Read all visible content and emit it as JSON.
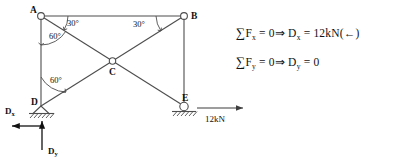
{
  "figure": {
    "nodes": [
      {
        "id": "A",
        "label": "A",
        "support": "pin-joint"
      },
      {
        "id": "B",
        "label": "B",
        "support": "pin-joint"
      },
      {
        "id": "C",
        "label": "C",
        "support": "pin-joint"
      },
      {
        "id": "D",
        "label": "D",
        "support": "pinned-support"
      },
      {
        "id": "E",
        "label": "E",
        "support": "roller-support"
      }
    ],
    "members": [
      {
        "from": "A",
        "to": "B"
      },
      {
        "from": "A",
        "to": "D"
      },
      {
        "from": "B",
        "to": "E"
      },
      {
        "from": "A",
        "to": "E"
      },
      {
        "from": "D",
        "to": "B"
      }
    ],
    "angles": [
      {
        "at": "A",
        "between": "AB-AE",
        "label": "30°"
      },
      {
        "at": "A",
        "between": "AD-AE",
        "label": "60°"
      },
      {
        "at": "B",
        "between": "BA-BD",
        "label": "30°"
      },
      {
        "at": "D",
        "between": "DA-DB",
        "label": "60°"
      }
    ],
    "forces": [
      {
        "name": "applied-load",
        "label": "12kN",
        "direction": "right",
        "at": "E"
      },
      {
        "name": "reaction-dx",
        "label": "D",
        "subscript": "x",
        "direction": "left",
        "at": "D"
      },
      {
        "name": "reaction-dy",
        "label": "D",
        "subscript": "y",
        "direction": "up",
        "at": "D"
      }
    ]
  },
  "equations": [
    {
      "id": "sum-fx",
      "sigma": "∑",
      "term": "F",
      "term_sub": "x",
      "equals_zero": "= 0",
      "implies": "⇒",
      "result": "D",
      "result_sub": "x",
      "result_value": "= 12kN(←)",
      "full_text": "∑ Fx = 0 ⇒ Dx = 12kN(←)"
    },
    {
      "id": "sum-fy",
      "sigma": "∑",
      "term": "F",
      "term_sub": "y",
      "equals_zero": "= 0",
      "implies": "⇒",
      "result": "D",
      "result_sub": "y",
      "result_value": "= 0",
      "full_text": "∑ Fy = 0 ⇒ Dy = 0"
    }
  ],
  "colors": {
    "stroke": "#4d4d4d",
    "text": "#111111",
    "background": "#ffffff"
  }
}
